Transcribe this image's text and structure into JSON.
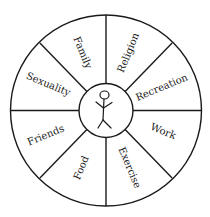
{
  "diagram": {
    "type": "wheel",
    "center": {
      "icon": "stick-figure-icon"
    },
    "segments": [
      {
        "label": "Family"
      },
      {
        "label": "Religion"
      },
      {
        "label": "Recreation"
      },
      {
        "label": "Work"
      },
      {
        "label": "Exercise"
      },
      {
        "label": "Food"
      },
      {
        "label": "Friends"
      },
      {
        "label": "Sexuality"
      }
    ],
    "colors": {
      "stroke": "#1a1a1a",
      "background": "#ffffff"
    }
  }
}
